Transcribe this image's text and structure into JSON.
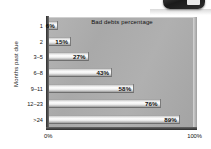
{
  "chart_data": {
    "type": "bar",
    "orientation": "horizontal",
    "title": "Bad debts percentage",
    "xlabel": "",
    "ylabel": "Months past due",
    "categories": [
      "1",
      "2",
      "3–5",
      "6–8",
      "9–11",
      "12–23",
      ">24"
    ],
    "values": [
      6,
      15,
      27,
      43,
      58,
      76,
      89
    ],
    "value_labels": [
      "6%",
      "15%",
      "27%",
      "43%",
      "58%",
      "76%",
      "89%"
    ],
    "xlim": [
      0,
      100
    ],
    "x_tick_labels": [
      "0%",
      "100%"
    ],
    "grid": false,
    "legend": null,
    "bar_style": "3d-gradient-grey",
    "colors": {
      "plot_background": "#ababab",
      "bar_highlight": "#ffffff",
      "bar_shadow": "#8f8f8f",
      "axis": "#2d2d2d",
      "text": "#111111",
      "page_background": "#ffffff"
    }
  },
  "axes": {
    "y_title": "Months past due",
    "x_ticks": {
      "left": "0%",
      "right": "100%"
    }
  },
  "decor": {
    "stray_object_name": "rounded-device-object"
  }
}
